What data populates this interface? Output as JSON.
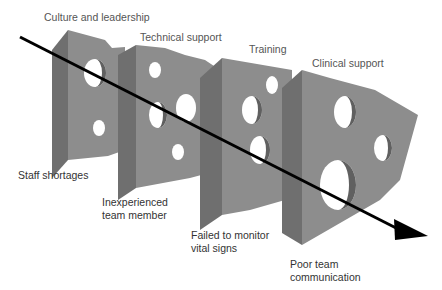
{
  "diagram": {
    "layers": [
      {
        "label": "Culture and leadership",
        "failure": "Staff shortages"
      },
      {
        "label": "Technical support",
        "failure": "Inexperienced team member"
      },
      {
        "label": "Training",
        "failure": "Failed to monitor vital signs"
      },
      {
        "label": "Clinical support",
        "failure": "Poor team communication"
      }
    ],
    "top_labels": {
      "l1": "Culture and leadership",
      "l2": "Technical support",
      "l3": "Training",
      "l4": "Clinical support"
    },
    "bottom_labels": {
      "b1": "Staff shortages",
      "b2a": "Inexperienced",
      "b2b": "team member",
      "b3a": "Failed to monitor",
      "b3b": "vital signs",
      "b4a": "Poor team",
      "b4b": "communication"
    },
    "colors": {
      "face": "#8c8c8c",
      "side": "#6e6e6e",
      "hole_inner": "#5f5f5f",
      "arrow": "#000000",
      "text": "#555555"
    }
  }
}
